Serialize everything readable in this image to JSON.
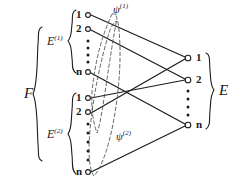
{
  "figure": {
    "type": "bipartite-mapping-diagram",
    "ink_color": "#1d1d1d",
    "dash_color": "#4a4a4a",
    "background": "#ffffff",
    "left_group_label": "F",
    "right_group_label": "E",
    "subsets": [
      {
        "label": "E",
        "superscript": "(1)",
        "map_label": "ψ",
        "map_superscript": "(1)"
      },
      {
        "label": "E",
        "superscript": "(2)",
        "map_label": "ψ",
        "map_superscript": "(2)"
      }
    ],
    "left_column": {
      "block1": {
        "indices": [
          "1",
          "2",
          "n"
        ],
        "ellipsis": "⋮"
      },
      "block2": {
        "indices": [
          "1",
          "2",
          "n"
        ],
        "ellipsis": "⋮"
      }
    },
    "right_column": {
      "indices": [
        "1",
        "2",
        "n"
      ],
      "ellipsis": "⋮"
    },
    "nodes": {
      "left_block1": [
        {
          "id": "L1-1",
          "label": "1",
          "x": 88,
          "y": 15
        },
        {
          "id": "L1-2",
          "label": "2",
          "x": 88,
          "y": 29
        },
        {
          "id": "L1-n",
          "label": "n",
          "x": 88,
          "y": 72
        }
      ],
      "left_block2": [
        {
          "id": "L2-1",
          "label": "1",
          "x": 88,
          "y": 98
        },
        {
          "id": "L2-2",
          "label": "2",
          "x": 88,
          "y": 112
        },
        {
          "id": "L2-n",
          "label": "n",
          "x": 88,
          "y": 172
        }
      ],
      "right": [
        {
          "id": "R-1",
          "label": "1",
          "x": 188,
          "y": 58
        },
        {
          "id": "R-2",
          "label": "2",
          "x": 188,
          "y": 80
        },
        {
          "id": "R-n",
          "label": "n",
          "x": 188,
          "y": 125
        }
      ]
    },
    "edges": [
      {
        "from": "L1-1",
        "to": "R-1"
      },
      {
        "from": "L1-2",
        "to": "R-2"
      },
      {
        "from": "L1-n",
        "to": "R-n"
      },
      {
        "from": "L2-1",
        "to": "R-2"
      },
      {
        "from": "L2-2",
        "to": "R-1"
      },
      {
        "from": "L2-n",
        "to": "R-n"
      }
    ],
    "psi_curves": [
      {
        "name": "psi-1",
        "label": "ψ",
        "superscript": "(1)"
      },
      {
        "name": "psi-2",
        "label": "ψ",
        "superscript": "(2)"
      }
    ]
  }
}
